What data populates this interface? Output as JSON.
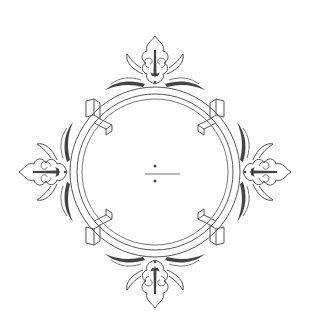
{
  "figure": {
    "type": "ornamental-frame",
    "center_symbol": "÷",
    "colors": {
      "background": "#ffffff",
      "line": "#555555",
      "fill_dark": "#444444"
    },
    "ornaments": [
      "top-ornament",
      "right-ornament",
      "bottom-ornament",
      "left-ornament"
    ],
    "clasps": [
      "top-left-clasp",
      "top-right-clasp",
      "bottom-right-clasp",
      "bottom-left-clasp"
    ]
  }
}
